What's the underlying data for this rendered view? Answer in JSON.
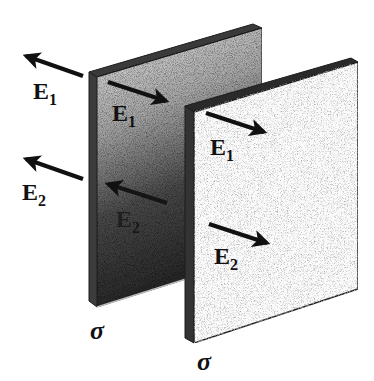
{
  "diagram": {
    "type": "parallel charged plates with electric field vectors",
    "colors": {
      "background": "#ffffff",
      "back_plate_top": "#d8d8d8",
      "back_plate_bottom": "#2e2e2e",
      "front_plate": "#fbfbfb",
      "edge": "#1c1c1c",
      "arrow": "#111111"
    },
    "plates": [
      {
        "id": "back",
        "charge_label": "σ",
        "fields": [
          {
            "label": "E",
            "subscript": "1",
            "side": "outside-left",
            "direction": "left"
          },
          {
            "label": "E",
            "subscript": "1",
            "side": "inside",
            "direction": "right"
          },
          {
            "label": "E",
            "subscript": "2",
            "side": "outside-left",
            "direction": "left"
          },
          {
            "label": "E",
            "subscript": "2",
            "side": "inside",
            "direction": "left"
          }
        ]
      },
      {
        "id": "front",
        "charge_label": "σ",
        "fields": [
          {
            "label": "E",
            "subscript": "1",
            "side": "outside-right",
            "direction": "right"
          },
          {
            "label": "E",
            "subscript": "2",
            "side": "outside-right",
            "direction": "right"
          }
        ]
      }
    ],
    "labels": {
      "e1_outer_left": {
        "main": "E",
        "sub": "1"
      },
      "e1_between": {
        "main": "E",
        "sub": "1"
      },
      "e1_outer_right": {
        "main": "E",
        "sub": "1"
      },
      "e2_outer_left": {
        "main": "E",
        "sub": "2"
      },
      "e2_between": {
        "main": "E",
        "sub": "2"
      },
      "e2_outer_right": {
        "main": "E",
        "sub": "2"
      },
      "sigma_back": "σ",
      "sigma_front": "σ"
    }
  }
}
